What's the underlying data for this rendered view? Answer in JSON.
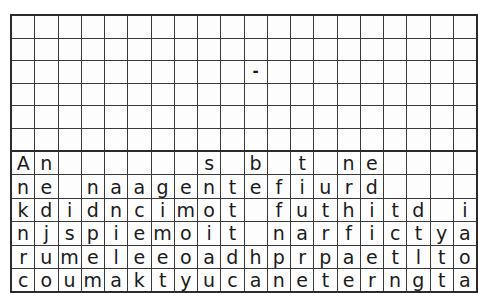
{
  "puzzle": {
    "type": "crossword-letter-grid",
    "columns": 20,
    "block_rows": 6,
    "letter_rows": 6,
    "colors": {
      "filled_cell": "#333333",
      "empty_cell": "#fdfdfd",
      "grid_line": "#3a3a3a",
      "outer_border": "#2b2b2b",
      "text": "#1b1b1b"
    },
    "block_grid": [
      [
        "",
        "",
        "#",
        "",
        "",
        "",
        "",
        "",
        "#",
        "",
        "",
        "",
        "#",
        "",
        "",
        "",
        "",
        "",
        "",
        "#"
      ],
      [
        "",
        "",
        "",
        "",
        "#",
        "",
        "#",
        "",
        "",
        "",
        "#",
        "",
        "",
        "",
        "#",
        "",
        "",
        "#",
        "",
        ""
      ],
      [
        "",
        "",
        "",
        "#",
        "",
        "#",
        "",
        "",
        "",
        "",
        "-",
        "",
        "",
        "",
        "",
        "",
        "",
        "",
        "#",
        ""
      ],
      [
        "",
        "",
        "",
        "",
        "",
        "",
        "",
        "",
        "",
        "",
        "#",
        "",
        "",
        "",
        "",
        "",
        "",
        "#",
        "",
        ""
      ],
      [
        "",
        "",
        "",
        "",
        "",
        "",
        "",
        "",
        "#",
        "",
        "",
        "",
        "#",
        "",
        "",
        "",
        "",
        "",
        "#",
        ""
      ],
      [
        "",
        "",
        "#",
        "",
        "",
        "",
        "",
        "#",
        "",
        "",
        "#",
        "",
        "",
        "",
        "",
        "",
        "",
        "",
        "#",
        ""
      ]
    ],
    "letter_grid": [
      [
        "A",
        "n",
        "",
        "",
        "",
        "",
        "",
        "",
        "s",
        "",
        "b",
        "",
        "t",
        "",
        "n",
        "e",
        "",
        "",
        "",
        ""
      ],
      [
        "n",
        "e",
        "",
        "n",
        "a",
        "a",
        "g",
        "e",
        "n",
        "t",
        "e",
        "f",
        "i",
        "u",
        "r",
        "d",
        "",
        "",
        "",
        ""
      ],
      [
        "k",
        "d",
        "i",
        "d",
        "n",
        "c",
        "i",
        "m",
        "o",
        "t",
        "",
        "f",
        "u",
        "t",
        "h",
        "i",
        "t",
        "d",
        "",
        "i"
      ],
      [
        "n",
        "j",
        "s",
        "p",
        "i",
        "e",
        "m",
        "o",
        "i",
        "t",
        "",
        "n",
        "a",
        "r",
        "f",
        "i",
        "c",
        "t",
        "y",
        "a"
      ],
      [
        "r",
        "u",
        "m",
        "e",
        "l",
        "e",
        "e",
        "o",
        "a",
        "d",
        "h",
        "p",
        "r",
        "p",
        "a",
        "e",
        "t",
        "l",
        "t",
        "o"
      ],
      [
        "c",
        "o",
        "u",
        "m",
        "a",
        "k",
        "t",
        "y",
        "u",
        "c",
        "a",
        "n",
        "e",
        "t",
        "e",
        "r",
        "n",
        "g",
        "t",
        "a"
      ]
    ]
  }
}
